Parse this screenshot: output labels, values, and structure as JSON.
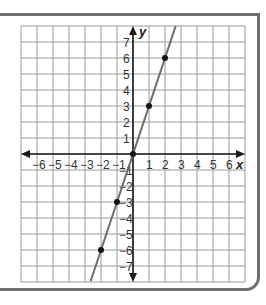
{
  "chart_data": {
    "type": "line",
    "title": "",
    "xlabel": "x",
    "ylabel": "y",
    "xlim": [
      -7,
      7
    ],
    "ylim": [
      -8,
      8
    ],
    "grid": true,
    "x_ticks": [
      -6,
      -5,
      -4,
      -3,
      -2,
      -1,
      1,
      2,
      3,
      4,
      5,
      6
    ],
    "y_ticks": [
      -7,
      -6,
      -5,
      -4,
      -3,
      -2,
      -1,
      1,
      2,
      3,
      4,
      5,
      6,
      7
    ],
    "x_tick_labels": [
      "−6",
      "−5",
      "−4",
      "−3",
      "−2",
      "−1",
      "1",
      "2",
      "3",
      "4",
      "5",
      "6"
    ],
    "y_tick_labels": [
      "−7",
      "−6",
      "−5",
      "−4",
      "−3",
      "−2",
      "−1",
      "1",
      "2",
      "3",
      "4",
      "5",
      "6",
      "7"
    ],
    "series": [
      {
        "name": "y = 3x",
        "slope": 3,
        "intercept": 0,
        "points": [
          [
            -2,
            -6
          ],
          [
            -1,
            -3
          ],
          [
            0,
            0
          ],
          [
            1,
            3
          ],
          [
            2,
            6
          ]
        ]
      }
    ]
  },
  "colors": {
    "grid": "#9a9a9a",
    "axis": "#1a1a1a",
    "line": "#6a6a6a",
    "point": "#111111",
    "frame": "#6f6f6f"
  }
}
